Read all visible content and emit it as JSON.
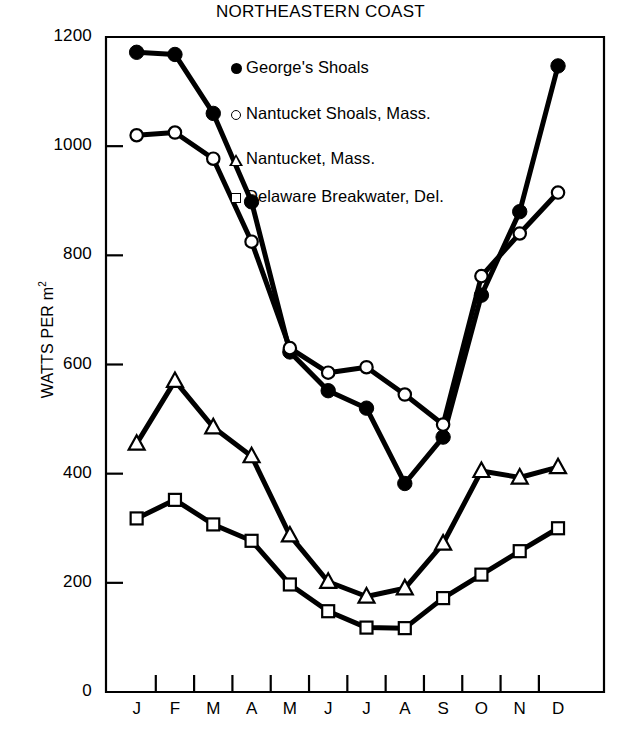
{
  "chart_data": {
    "type": "line",
    "title": "NORTHEASTERN COAST",
    "xlabel": "",
    "ylabel": "WATTS PER m2",
    "ylabel_prefix": "WATTS PER m",
    "ylabel_sup": "2",
    "categories": [
      "J",
      "F",
      "M",
      "A",
      "M",
      "J",
      "J",
      "A",
      "S",
      "O",
      "N",
      "D"
    ],
    "xtick_labels": [
      "J",
      "F",
      "M",
      "A",
      "M",
      "J",
      "J",
      "A",
      "S",
      "O",
      "N",
      "D"
    ],
    "ytick_labels": [
      "1200",
      "1000",
      "800",
      "600",
      "400",
      "200",
      "0"
    ],
    "ytick_values": [
      1200,
      1000,
      800,
      600,
      400,
      200,
      0
    ],
    "ylim": [
      0,
      1200
    ],
    "grid": false,
    "legend_position": "upper-center-right",
    "series": [
      {
        "name": "George's Shoals",
        "marker": "filled-circle",
        "values": [
          1172,
          1168,
          1060,
          898,
          623,
          552,
          520,
          382,
          467,
          727,
          880,
          1147
        ]
      },
      {
        "name": "Nantucket Shoals, Mass.",
        "marker": "open-circle",
        "values": [
          1020,
          1025,
          977,
          825,
          630,
          585,
          595,
          545,
          490,
          762,
          840,
          915
        ]
      },
      {
        "name": "Nantucket, Mass.",
        "marker": "open-triangle",
        "values": [
          455,
          570,
          485,
          432,
          287,
          202,
          175,
          190,
          272,
          405,
          393,
          412
        ]
      },
      {
        "name": "Delaware Breakwater, Del.",
        "marker": "open-square",
        "values": [
          318,
          352,
          307,
          277,
          197,
          148,
          118,
          117,
          172,
          215,
          258,
          300
        ]
      }
    ]
  },
  "legend": {
    "entries": [
      {
        "label": "George's Shoals",
        "symbol": "filled-circle"
      },
      {
        "label": "Nantucket Shoals, Mass.",
        "symbol": "open-circle"
      },
      {
        "label": "Nantucket, Mass.",
        "symbol": "open-triangle"
      },
      {
        "label": "Delaware Breakwater, Del.",
        "symbol": "open-square"
      }
    ]
  },
  "colors": {
    "line": "#000000",
    "axis": "#000000",
    "background": "#ffffff"
  }
}
